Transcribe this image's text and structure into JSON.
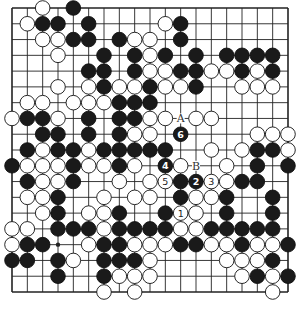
{
  "diagram": {
    "type": "go-board",
    "size": 19,
    "colors": {
      "background": "#ffffff",
      "line": "#222222",
      "black": "#1a1a1a",
      "white": "#ffffff"
    },
    "labels": [
      {
        "text": "A",
        "col": 11,
        "row": 7
      },
      {
        "text": "B",
        "col": 12,
        "row": 10
      }
    ],
    "numbered_moves": [
      {
        "n": "1",
        "color": "white",
        "col": 11,
        "row": 13
      },
      {
        "n": "2",
        "color": "black",
        "col": 12,
        "row": 11
      },
      {
        "n": "3",
        "color": "white",
        "col": 13,
        "row": 11
      },
      {
        "n": "4",
        "color": "black",
        "col": 10,
        "row": 10
      },
      {
        "n": "5",
        "color": "white",
        "col": 10,
        "row": 11
      },
      {
        "n": "6",
        "color": "black",
        "col": 11,
        "row": 8
      }
    ],
    "star_points": [
      [
        3,
        15
      ]
    ],
    "black": [
      [
        4,
        0
      ],
      [
        2,
        1
      ],
      [
        3,
        1
      ],
      [
        5,
        1
      ],
      [
        11,
        1
      ],
      [
        4,
        2
      ],
      [
        5,
        2
      ],
      [
        7,
        2
      ],
      [
        11,
        2
      ],
      [
        6,
        3
      ],
      [
        8,
        3
      ],
      [
        10,
        3
      ],
      [
        12,
        3
      ],
      [
        14,
        3
      ],
      [
        15,
        3
      ],
      [
        16,
        3
      ],
      [
        17,
        3
      ],
      [
        5,
        4
      ],
      [
        6,
        4
      ],
      [
        8,
        4
      ],
      [
        11,
        4
      ],
      [
        12,
        4
      ],
      [
        15,
        4
      ],
      [
        17,
        4
      ],
      [
        6,
        5
      ],
      [
        9,
        5
      ],
      [
        12,
        5
      ],
      [
        7,
        6
      ],
      [
        8,
        6
      ],
      [
        9,
        6
      ],
      [
        1,
        7
      ],
      [
        2,
        7
      ],
      [
        5,
        7
      ],
      [
        7,
        7
      ],
      [
        8,
        7
      ],
      [
        2,
        8
      ],
      [
        3,
        8
      ],
      [
        5,
        8
      ],
      [
        7,
        8
      ],
      [
        1,
        9
      ],
      [
        3,
        9
      ],
      [
        4,
        9
      ],
      [
        6,
        9
      ],
      [
        7,
        9
      ],
      [
        8,
        9
      ],
      [
        9,
        9
      ],
      [
        10,
        9
      ],
      [
        16,
        9
      ],
      [
        17,
        9
      ],
      [
        0,
        10
      ],
      [
        4,
        10
      ],
      [
        7,
        10
      ],
      [
        16,
        10
      ],
      [
        18,
        10
      ],
      [
        1,
        11
      ],
      [
        4,
        11
      ],
      [
        11,
        11
      ],
      [
        15,
        11
      ],
      [
        16,
        11
      ],
      [
        3,
        12
      ],
      [
        11,
        12
      ],
      [
        14,
        12
      ],
      [
        17,
        12
      ],
      [
        3,
        13
      ],
      [
        7,
        13
      ],
      [
        10,
        13
      ],
      [
        14,
        13
      ],
      [
        17,
        13
      ],
      [
        3,
        14
      ],
      [
        4,
        14
      ],
      [
        5,
        14
      ],
      [
        7,
        14
      ],
      [
        8,
        14
      ],
      [
        9,
        14
      ],
      [
        10,
        14
      ],
      [
        13,
        14
      ],
      [
        14,
        14
      ],
      [
        15,
        14
      ],
      [
        16,
        14
      ],
      [
        17,
        14
      ],
      [
        1,
        15
      ],
      [
        2,
        15
      ],
      [
        6,
        15
      ],
      [
        7,
        15
      ],
      [
        11,
        15
      ],
      [
        12,
        15
      ],
      [
        15,
        15
      ],
      [
        18,
        15
      ],
      [
        0,
        16
      ],
      [
        1,
        16
      ],
      [
        3,
        16
      ],
      [
        6,
        16
      ],
      [
        7,
        16
      ],
      [
        8,
        16
      ],
      [
        17,
        16
      ],
      [
        3,
        17
      ],
      [
        6,
        17
      ],
      [
        16,
        17
      ],
      [
        18,
        17
      ]
    ],
    "white": [
      [
        2,
        0
      ],
      [
        1,
        1
      ],
      [
        10,
        1
      ],
      [
        2,
        2
      ],
      [
        3,
        2
      ],
      [
        8,
        2
      ],
      [
        9,
        2
      ],
      [
        3,
        3
      ],
      [
        9,
        3
      ],
      [
        9,
        4
      ],
      [
        10,
        4
      ],
      [
        13,
        4
      ],
      [
        14,
        4
      ],
      [
        16,
        4
      ],
      [
        3,
        5
      ],
      [
        5,
        5
      ],
      [
        7,
        5
      ],
      [
        8,
        5
      ],
      [
        10,
        5
      ],
      [
        11,
        5
      ],
      [
        15,
        5
      ],
      [
        16,
        5
      ],
      [
        17,
        5
      ],
      [
        1,
        6
      ],
      [
        2,
        6
      ],
      [
        4,
        6
      ],
      [
        5,
        6
      ],
      [
        6,
        6
      ],
      [
        0,
        7
      ],
      [
        3,
        7
      ],
      [
        9,
        7
      ],
      [
        10,
        7
      ],
      [
        12,
        7
      ],
      [
        13,
        7
      ],
      [
        8,
        8
      ],
      [
        9,
        8
      ],
      [
        16,
        8
      ],
      [
        17,
        8
      ],
      [
        18,
        8
      ],
      [
        2,
        9
      ],
      [
        5,
        9
      ],
      [
        13,
        9
      ],
      [
        15,
        9
      ],
      [
        18,
        9
      ],
      [
        1,
        10
      ],
      [
        2,
        10
      ],
      [
        3,
        10
      ],
      [
        5,
        10
      ],
      [
        6,
        10
      ],
      [
        8,
        10
      ],
      [
        11,
        10
      ],
      [
        14,
        10
      ],
      [
        2,
        11
      ],
      [
        3,
        11
      ],
      [
        7,
        11
      ],
      [
        9,
        11
      ],
      [
        14,
        11
      ],
      [
        1,
        12
      ],
      [
        2,
        12
      ],
      [
        6,
        12
      ],
      [
        8,
        12
      ],
      [
        9,
        12
      ],
      [
        12,
        12
      ],
      [
        13,
        12
      ],
      [
        2,
        13
      ],
      [
        5,
        13
      ],
      [
        6,
        13
      ],
      [
        12,
        13
      ],
      [
        0,
        14
      ],
      [
        1,
        14
      ],
      [
        6,
        14
      ],
      [
        11,
        14
      ],
      [
        12,
        14
      ],
      [
        0,
        15
      ],
      [
        5,
        15
      ],
      [
        8,
        15
      ],
      [
        9,
        15
      ],
      [
        10,
        15
      ],
      [
        13,
        15
      ],
      [
        14,
        15
      ],
      [
        16,
        15
      ],
      [
        17,
        15
      ],
      [
        4,
        16
      ],
      [
        9,
        16
      ],
      [
        14,
        16
      ],
      [
        15,
        16
      ],
      [
        16,
        16
      ],
      [
        7,
        17
      ],
      [
        8,
        17
      ],
      [
        9,
        17
      ],
      [
        15,
        17
      ],
      [
        17,
        17
      ],
      [
        6,
        18
      ],
      [
        8,
        18
      ],
      [
        17,
        18
      ]
    ]
  }
}
